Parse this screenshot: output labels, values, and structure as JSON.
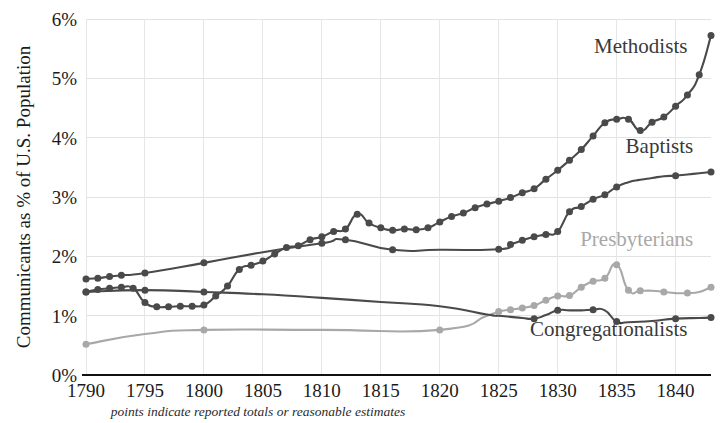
{
  "chart_data": {
    "type": "line",
    "title": "",
    "xlabel": "",
    "ylabel": "Communicants as % of U.S. Population",
    "footnote": "points indicate reported totals or reasonable estimates",
    "xlim": [
      1790,
      1843
    ],
    "ylim": [
      0,
      6
    ],
    "x_ticks": [
      1790,
      1795,
      1800,
      1805,
      1810,
      1815,
      1820,
      1825,
      1830,
      1835,
      1840
    ],
    "x_tick_labels": [
      "1790",
      "1795",
      "1800",
      "1805",
      "1810",
      "1815",
      "1820",
      "1825",
      "1830",
      "1835",
      "1840"
    ],
    "y_ticks": [
      0,
      1,
      2,
      3,
      4,
      5,
      6
    ],
    "y_tick_labels": [
      "0%",
      "1%",
      "2%",
      "3%",
      "4%",
      "5%",
      "6%"
    ],
    "grid": true,
    "legend_position": "inline-right-labels",
    "series": [
      {
        "name": "Methodists",
        "color": "#4a4a4a",
        "label_color": "#3a3a3a",
        "label_x": 1841.0,
        "label_y": 5.42,
        "x": [
          1790,
          1791,
          1792,
          1793,
          1794,
          1795,
          1796,
          1797,
          1798,
          1799,
          1800,
          1801,
          1802,
          1803,
          1804,
          1805,
          1806,
          1807,
          1808,
          1809,
          1810,
          1811,
          1812,
          1813,
          1814,
          1815,
          1816,
          1817,
          1818,
          1819,
          1820,
          1821,
          1822,
          1823,
          1824,
          1825,
          1826,
          1827,
          1828,
          1829,
          1830,
          1831,
          1832,
          1833,
          1834,
          1835,
          1836,
          1837,
          1838,
          1839,
          1840,
          1841,
          1842,
          1843
        ],
        "y": [
          1.4,
          1.44,
          1.46,
          1.48,
          1.46,
          1.22,
          1.15,
          1.15,
          1.16,
          1.16,
          1.18,
          1.33,
          1.5,
          1.78,
          1.85,
          1.92,
          2.04,
          2.15,
          2.18,
          2.28,
          2.33,
          2.42,
          2.46,
          2.71,
          2.56,
          2.48,
          2.44,
          2.46,
          2.45,
          2.48,
          2.58,
          2.67,
          2.73,
          2.82,
          2.88,
          2.93,
          2.99,
          3.07,
          3.14,
          3.3,
          3.45,
          3.62,
          3.8,
          4.03,
          4.25,
          4.31,
          4.31,
          4.12,
          4.26,
          4.35,
          4.53,
          4.72,
          5.06,
          5.72
        ],
        "points": [
          1790,
          1791,
          1792,
          1793,
          1794,
          1795,
          1796,
          1797,
          1798,
          1799,
          1800,
          1801,
          1802,
          1803,
          1804,
          1805,
          1806,
          1807,
          1808,
          1809,
          1810,
          1811,
          1812,
          1813,
          1814,
          1815,
          1816,
          1817,
          1818,
          1819,
          1820,
          1821,
          1822,
          1823,
          1824,
          1825,
          1826,
          1827,
          1828,
          1829,
          1830,
          1831,
          1832,
          1833,
          1834,
          1835,
          1836,
          1837,
          1838,
          1839,
          1840,
          1841,
          1842,
          1843
        ]
      },
      {
        "name": "Baptists",
        "color": "#4a4a4a",
        "label_color": "#3a3a3a",
        "label_x": 1841.5,
        "label_y": 3.74,
        "x": [
          1790,
          1791,
          1792,
          1793,
          1795,
          1800,
          1805,
          1810,
          1812,
          1816,
          1820,
          1825,
          1826,
          1827,
          1828,
          1829,
          1830,
          1831,
          1832,
          1833,
          1834,
          1835,
          1836,
          1837,
          1838,
          1839,
          1840,
          1841,
          1842,
          1843
        ],
        "y": [
          1.62,
          1.63,
          1.66,
          1.68,
          1.72,
          1.89,
          2.07,
          2.22,
          2.28,
          2.11,
          2.11,
          2.12,
          2.2,
          2.27,
          2.33,
          2.37,
          2.42,
          2.75,
          2.84,
          2.96,
          3.04,
          3.17,
          3.25,
          3.29,
          3.32,
          3.35,
          3.36,
          3.38,
          3.4,
          3.42
        ],
        "points": [
          1790,
          1791,
          1792,
          1793,
          1795,
          1800,
          1810,
          1812,
          1816,
          1825,
          1826,
          1827,
          1828,
          1829,
          1830,
          1831,
          1832,
          1833,
          1834,
          1835,
          1840,
          1843
        ]
      },
      {
        "name": "Presbyterians",
        "color": "#a8a8a8",
        "label_color": "#a8a8a8",
        "label_x": 1841.5,
        "label_y": 2.18,
        "x": [
          1790,
          1795,
          1800,
          1810,
          1820,
          1824,
          1825,
          1826,
          1827,
          1828,
          1829,
          1830,
          1831,
          1832,
          1833,
          1834,
          1835,
          1836,
          1837,
          1838,
          1839,
          1840,
          1841,
          1842,
          1843
        ],
        "y": [
          0.52,
          0.69,
          0.76,
          0.76,
          0.76,
          1.0,
          1.07,
          1.1,
          1.13,
          1.17,
          1.26,
          1.33,
          1.34,
          1.48,
          1.58,
          1.63,
          1.86,
          1.43,
          1.42,
          1.42,
          1.4,
          1.38,
          1.38,
          1.4,
          1.48
        ],
        "points": [
          1790,
          1800,
          1820,
          1825,
          1826,
          1827,
          1828,
          1829,
          1830,
          1831,
          1832,
          1833,
          1834,
          1835,
          1836,
          1837,
          1839,
          1841,
          1843
        ]
      },
      {
        "name": "Congregationalists",
        "color": "#4a4a4a",
        "label_color": "#3a3a3a",
        "label_x": 1841.0,
        "label_y": 0.66,
        "x": [
          1790,
          1795,
          1800,
          1805,
          1810,
          1815,
          1820,
          1824,
          1825,
          1826,
          1827,
          1828,
          1829,
          1830,
          1831,
          1832,
          1833,
          1834,
          1835,
          1836,
          1838,
          1840,
          1842,
          1843
        ],
        "y": [
          1.4,
          1.43,
          1.4,
          1.36,
          1.3,
          1.23,
          1.16,
          1.02,
          1.0,
          0.98,
          0.96,
          0.95,
          1.01,
          1.09,
          1.09,
          1.09,
          1.1,
          1.09,
          0.9,
          0.89,
          0.91,
          0.95,
          0.96,
          0.97
        ],
        "points": [
          1790,
          1792,
          1795,
          1800,
          1828,
          1830,
          1833,
          1835,
          1840,
          1843
        ]
      }
    ]
  },
  "axis": {
    "y_label": "Communicants as % of U.S. Population",
    "footnote": "points indicate reported totals or reasonable estimates"
  }
}
